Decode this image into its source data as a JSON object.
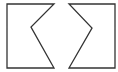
{
  "canvas": {
    "width": 118,
    "height": 72,
    "background": "#ffffff"
  },
  "stroke": {
    "color": "#333333",
    "width": 1.3
  },
  "shapes": [
    {
      "name": "left-notched-shape",
      "points": "7,4 54,4 31,27 54,68 7,68"
    },
    {
      "name": "right-notched-shape",
      "points": "69,4 115,4 115,68 69,68 92,28"
    }
  ]
}
